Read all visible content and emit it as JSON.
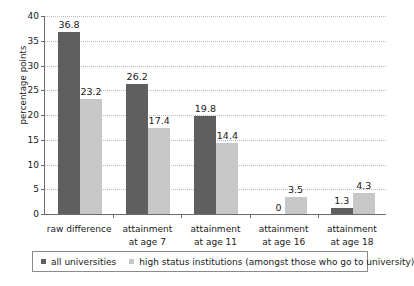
{
  "chart_data": {
    "type": "bar",
    "title": "",
    "subtitle": "",
    "xlabel": "",
    "ylabel": "percentage points",
    "ylim": [
      0,
      40
    ],
    "ytick_step": 5,
    "yticks": [
      40,
      35,
      30,
      25,
      20,
      15,
      10,
      5,
      0
    ],
    "grid": true,
    "grid_axis": "y",
    "grid_style": "dotted",
    "legend_position": "bottom",
    "legend_boxed": true,
    "categories": [
      "raw difference",
      "attainment at age 7",
      "attainment at age 11",
      "attainment at age 16",
      "attainment at age 18"
    ],
    "category_lines": [
      [
        "raw difference"
      ],
      [
        "attainment",
        "at age 7"
      ],
      [
        "attainment",
        "at age 11"
      ],
      [
        "attainment",
        "at age 16"
      ],
      [
        "attainment",
        "at age 18"
      ]
    ],
    "series": [
      {
        "name": "all universities",
        "color": "#5f5f5f",
        "values": [
          36.8,
          26.2,
          19.8,
          0,
          1.3
        ],
        "labels": [
          "36.8",
          "26.2",
          "19.8",
          "0",
          "1.3"
        ]
      },
      {
        "name": "high status institutions (amongst those who go to university)",
        "color": "#c7c7c7",
        "values": [
          23.2,
          17.4,
          14.4,
          3.5,
          4.3
        ],
        "labels": [
          "23.2",
          "17.4",
          "14.4",
          "3.5",
          "4.3"
        ]
      }
    ]
  },
  "legend": {
    "entries": [
      {
        "label": "all universities",
        "color": "#5f5f5f"
      },
      {
        "label": "high status institutions (amongst those who go to university)",
        "color": "#c7c7c7"
      }
    ]
  },
  "axis": {
    "y_title": "percentage points",
    "y_labels": [
      "40",
      "35",
      "30",
      "25",
      "20",
      "15",
      "10",
      "5",
      "0"
    ]
  },
  "colors": {
    "series_dark": "#5f5f5f",
    "series_light": "#c7c7c7",
    "axis_line": "#6b6b6b",
    "gridline": "#b9b9c6",
    "text": "#1a1a1a",
    "background": "#ffffff"
  }
}
